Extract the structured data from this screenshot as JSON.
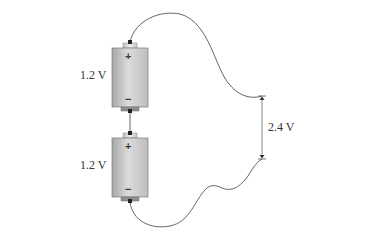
{
  "diagram": {
    "batteries": [
      {
        "id": "top",
        "voltage_label": "1.2 V",
        "positive": "+",
        "negative": "−"
      },
      {
        "id": "bottom",
        "voltage_label": "1.2 V",
        "positive": "+",
        "negative": "−"
      }
    ],
    "total_voltage_label": "2.4 V",
    "colors": {
      "battery_light": "#e8e8e8",
      "battery_dark": "#a9a9a9",
      "wire": "#555555",
      "terminal": "#d0d0d0",
      "bracket": "#777777"
    }
  }
}
